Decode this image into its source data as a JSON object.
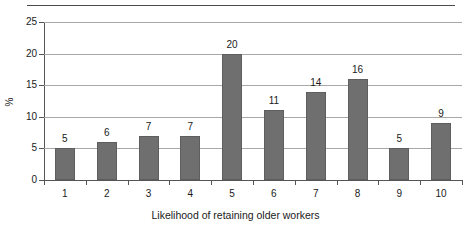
{
  "chart_data": {
    "type": "bar",
    "title": "",
    "xlabel": "Likelihood of retaining older workers",
    "ylabel": "%",
    "categories": [
      "1",
      "2",
      "3",
      "4",
      "5",
      "6",
      "7",
      "8",
      "9",
      "10"
    ],
    "values": [
      5,
      6,
      7,
      7,
      20,
      11,
      14,
      16,
      5,
      9
    ],
    "data_labels": [
      "5",
      "6",
      "7",
      "7",
      "20",
      "11",
      "14",
      "16",
      "5",
      "9"
    ],
    "ylim": [
      0,
      25
    ],
    "ytick_labels": [
      "0",
      "5",
      "10",
      "15",
      "20",
      "25"
    ],
    "ytick_values": [
      0,
      5,
      10,
      15,
      20,
      25
    ],
    "grid": "horizontal",
    "legend": "none",
    "bar_color": "#6f6f6f",
    "bar_border_color": "#5e5e5e",
    "gridline_color": "#a8a8a8",
    "axis_color": "#555555",
    "background": "#ffffff",
    "top_rule_color": "#4c4c4c"
  }
}
